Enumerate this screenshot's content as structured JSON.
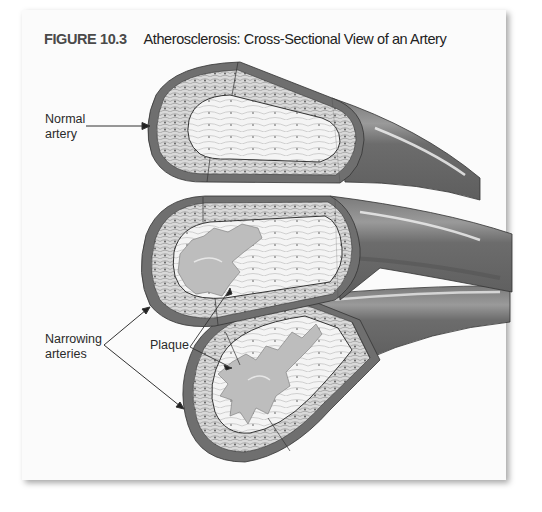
{
  "figure": {
    "number": "FIGURE 10.3",
    "caption": "Atherosclerosis: Cross-Sectional View of an Artery"
  },
  "labels": {
    "normal": {
      "line1": "Normal",
      "line2": "artery"
    },
    "narrowing": {
      "line1": "Narrowing",
      "line2": "arteries"
    },
    "plaque": "Plaque"
  },
  "arteries": [
    {
      "id": "normal-artery",
      "state": "normal",
      "plaque": false
    },
    {
      "id": "narrowing-artery-1",
      "state": "narrowing",
      "plaque": true
    },
    {
      "id": "narrowing-artery-2",
      "state": "narrowing",
      "plaque": true
    }
  ],
  "colors": {
    "outer_wall": "#6f6f6f",
    "tube_shading": "#8a8a8a",
    "tissue": "#d8d8d8",
    "lumen": "#f2f2f2",
    "plaque": "#bdbdbd",
    "text": "#2a2a2a"
  }
}
